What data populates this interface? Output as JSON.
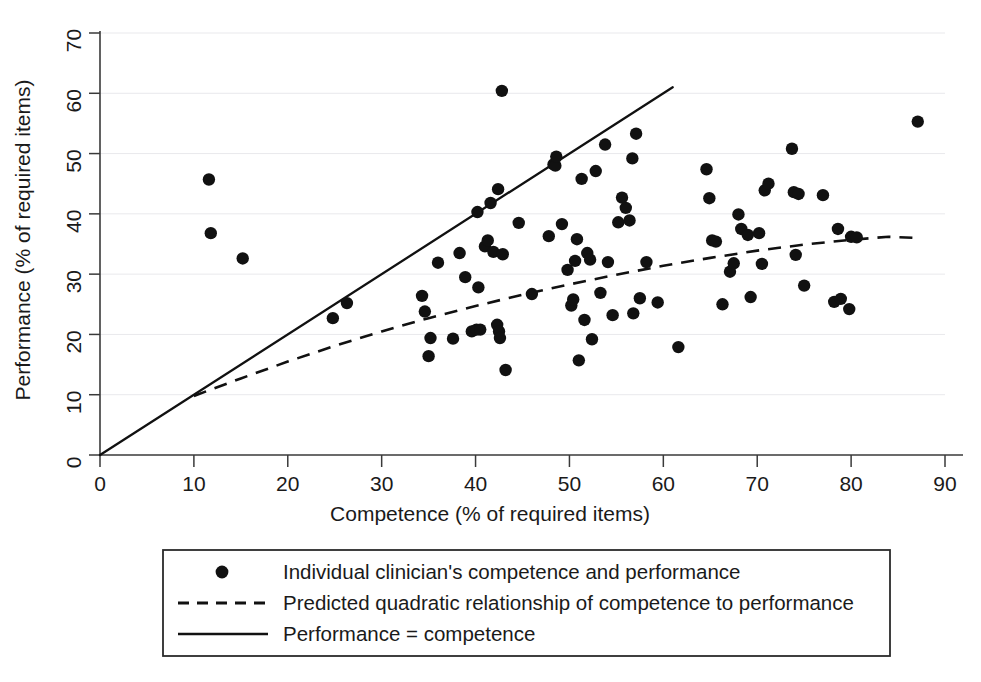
{
  "chart_data": {
    "type": "scatter",
    "title": "",
    "xlabel": "Competence (% of required items)",
    "ylabel": "Performance (% of required items)",
    "xlim": [
      0,
      90
    ],
    "ylim": [
      0,
      70
    ],
    "xticks": [
      0,
      10,
      20,
      30,
      40,
      50,
      60,
      70,
      80,
      90
    ],
    "yticks": [
      0,
      10,
      20,
      30,
      40,
      50,
      60,
      70
    ],
    "grid": "horizontal",
    "legend_position": "below-plot",
    "series": [
      {
        "name": "Individual clinician's competence and performance",
        "type": "scatter",
        "marker": "filled-circle",
        "color": "#111111",
        "points": [
          [
            11.6,
            45.7
          ],
          [
            11.8,
            36.8
          ],
          [
            15.2,
            32.6
          ],
          [
            24.8,
            22.7
          ],
          [
            26.3,
            25.2
          ],
          [
            34.3,
            26.4
          ],
          [
            34.6,
            23.8
          ],
          [
            35.0,
            16.4
          ],
          [
            35.2,
            19.4
          ],
          [
            36.0,
            31.9
          ],
          [
            37.6,
            19.3
          ],
          [
            38.3,
            33.5
          ],
          [
            38.9,
            29.5
          ],
          [
            39.6,
            20.5
          ],
          [
            40.1,
            20.8
          ],
          [
            40.2,
            40.3
          ],
          [
            40.3,
            27.8
          ],
          [
            40.5,
            20.8
          ],
          [
            41.0,
            34.6
          ],
          [
            41.3,
            35.6
          ],
          [
            41.6,
            41.8
          ],
          [
            41.9,
            33.7
          ],
          [
            42.3,
            21.6
          ],
          [
            42.4,
            44.1
          ],
          [
            42.5,
            20.5
          ],
          [
            42.6,
            19.4
          ],
          [
            42.8,
            60.4
          ],
          [
            42.9,
            33.3
          ],
          [
            43.2,
            14.1
          ],
          [
            44.6,
            38.5
          ],
          [
            46.0,
            26.7
          ],
          [
            47.8,
            36.3
          ],
          [
            48.3,
            48.2
          ],
          [
            48.5,
            48.0
          ],
          [
            48.6,
            49.5
          ],
          [
            49.2,
            38.3
          ],
          [
            49.8,
            30.7
          ],
          [
            50.2,
            24.8
          ],
          [
            50.4,
            25.8
          ],
          [
            50.6,
            32.2
          ],
          [
            50.8,
            35.8
          ],
          [
            51.0,
            15.7
          ],
          [
            51.3,
            45.8
          ],
          [
            51.6,
            22.4
          ],
          [
            51.9,
            33.5
          ],
          [
            52.2,
            32.4
          ],
          [
            52.4,
            19.2
          ],
          [
            52.8,
            47.1
          ],
          [
            53.3,
            26.9
          ],
          [
            53.8,
            51.5
          ],
          [
            54.1,
            32.0
          ],
          [
            54.6,
            23.2
          ],
          [
            55.2,
            38.6
          ],
          [
            55.6,
            42.7
          ],
          [
            56.0,
            41.0
          ],
          [
            56.4,
            38.9
          ],
          [
            56.7,
            49.2
          ],
          [
            56.8,
            23.5
          ],
          [
            57.1,
            53.3
          ],
          [
            57.5,
            26.0
          ],
          [
            58.2,
            32.0
          ],
          [
            59.4,
            25.3
          ],
          [
            61.6,
            17.9
          ],
          [
            64.6,
            47.4
          ],
          [
            64.9,
            42.6
          ],
          [
            65.2,
            35.6
          ],
          [
            65.6,
            35.4
          ],
          [
            66.3,
            25.0
          ],
          [
            67.1,
            30.4
          ],
          [
            67.5,
            31.8
          ],
          [
            68.0,
            39.9
          ],
          [
            68.3,
            37.5
          ],
          [
            69.0,
            36.5
          ],
          [
            69.3,
            26.2
          ],
          [
            70.2,
            36.8
          ],
          [
            70.5,
            31.7
          ],
          [
            70.8,
            43.9
          ],
          [
            71.2,
            45.0
          ],
          [
            73.7,
            50.8
          ],
          [
            73.9,
            43.6
          ],
          [
            74.1,
            33.2
          ],
          [
            74.4,
            43.3
          ],
          [
            75.0,
            28.1
          ],
          [
            77.0,
            43.1
          ],
          [
            78.2,
            25.4
          ],
          [
            78.6,
            37.5
          ],
          [
            78.9,
            25.9
          ],
          [
            79.8,
            24.2
          ],
          [
            80.0,
            36.2
          ],
          [
            80.6,
            36.1
          ],
          [
            87.1,
            55.3
          ]
        ]
      },
      {
        "name": "Predicted quadratic relationship of competence to performance",
        "type": "line",
        "style": "dashed",
        "color": "#111111",
        "x_range": [
          10,
          87
        ],
        "coefficients": {
          "a": -0.0047,
          "b": 0.714,
          "c": 3.1
        },
        "points": [
          [
            10,
            9.8
          ],
          [
            15,
            12.7
          ],
          [
            20,
            15.5
          ],
          [
            25,
            18.1
          ],
          [
            30,
            20.5
          ],
          [
            35,
            22.7
          ],
          [
            40,
            24.7
          ],
          [
            45,
            26.6
          ],
          [
            50,
            28.3
          ],
          [
            55,
            29.9
          ],
          [
            60,
            31.4
          ],
          [
            65,
            32.7
          ],
          [
            70,
            33.9
          ],
          [
            75,
            34.9
          ],
          [
            80,
            35.7
          ],
          [
            84,
            36.2
          ],
          [
            87,
            36.0
          ]
        ]
      },
      {
        "name": "Performance = competence",
        "type": "line",
        "style": "solid",
        "color": "#111111",
        "x_range": [
          0,
          61
        ],
        "points": [
          [
            0,
            0
          ],
          [
            61,
            61
          ]
        ]
      }
    ]
  },
  "legend": {
    "entries": [
      {
        "marker": "filled-circle",
        "label": "Individual clinician's competence and performance"
      },
      {
        "marker": "dashed-line",
        "label": "Predicted quadratic relationship of competence to performance"
      },
      {
        "marker": "solid-line",
        "label": "Performance = competence"
      }
    ]
  }
}
